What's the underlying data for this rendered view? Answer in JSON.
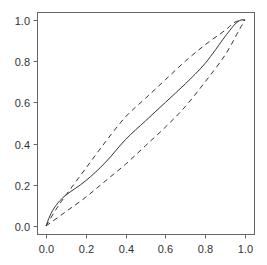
{
  "chart_data": {
    "type": "line",
    "title": "",
    "xlabel": "",
    "ylabel": "",
    "xlim": [
      0.0,
      1.0
    ],
    "ylim": [
      0.0,
      1.0
    ],
    "grid": false,
    "legend": null,
    "x_ticks": [
      "0.0",
      "0.2",
      "0.4",
      "0.6",
      "0.8",
      "1.0"
    ],
    "y_ticks": [
      "0.0",
      "0.2",
      "0.4",
      "0.6",
      "0.8",
      "1.0"
    ],
    "series": [
      {
        "name": "estimate",
        "style": "solid",
        "color": "#333333",
        "x": [
          0.0,
          0.02,
          0.05,
          0.1,
          0.2,
          0.3,
          0.4,
          0.5,
          0.6,
          0.7,
          0.8,
          0.9,
          0.95,
          0.98,
          1.0
        ],
        "y": [
          0.0,
          0.05,
          0.1,
          0.15,
          0.22,
          0.31,
          0.42,
          0.51,
          0.6,
          0.69,
          0.79,
          0.92,
          0.98,
          1.0,
          1.0
        ]
      },
      {
        "name": "upper-band",
        "style": "dashed",
        "color": "#333333",
        "x": [
          0.0,
          0.05,
          0.1,
          0.2,
          0.3,
          0.4,
          0.5,
          0.6,
          0.7,
          0.8,
          0.9,
          0.95,
          1.0
        ],
        "y": [
          0.0,
          0.08,
          0.15,
          0.28,
          0.41,
          0.53,
          0.62,
          0.71,
          0.8,
          0.88,
          0.95,
          0.99,
          1.0
        ]
      },
      {
        "name": "lower-band",
        "style": "dashed",
        "color": "#333333",
        "x": [
          0.0,
          0.1,
          0.2,
          0.3,
          0.4,
          0.5,
          0.6,
          0.7,
          0.8,
          0.9,
          0.97,
          1.0
        ],
        "y": [
          0.0,
          0.07,
          0.14,
          0.22,
          0.3,
          0.39,
          0.48,
          0.58,
          0.7,
          0.83,
          0.95,
          1.0
        ]
      }
    ]
  },
  "layout": {
    "frame": {
      "left": 37,
      "top": 12,
      "right": 254,
      "bottom": 234
    },
    "x_map": {
      "px0": 46,
      "px1": 245
    },
    "y_map": {
      "py0": 226,
      "py1": 20
    },
    "frame_color": "#666666",
    "tick_len": 4
  }
}
